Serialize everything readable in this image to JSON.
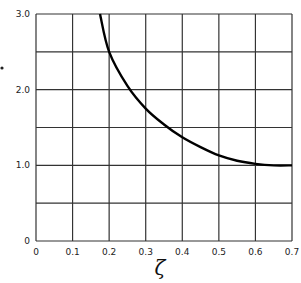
{
  "chart_data": {
    "type": "line",
    "title": "",
    "xlabel": "ζ",
    "ylabel": "",
    "xlim": [
      0,
      0.7
    ],
    "ylim": [
      0,
      3.0
    ],
    "grid": true,
    "x_ticks": [
      "0",
      "0.1",
      "0.2",
      "0.3",
      "0.4",
      "0.5",
      "0.6",
      "0.7"
    ],
    "y_ticks": [
      "0",
      "1.0",
      "2.0",
      "3.0"
    ],
    "series": [
      {
        "name": "curve",
        "x": [
          0.175,
          0.2,
          0.25,
          0.3,
          0.35,
          0.4,
          0.45,
          0.5,
          0.55,
          0.6,
          0.65,
          0.7
        ],
        "values": [
          3.0,
          2.5,
          2.05,
          1.75,
          1.54,
          1.37,
          1.24,
          1.13,
          1.06,
          1.02,
          1.0,
          1.0
        ]
      }
    ]
  }
}
